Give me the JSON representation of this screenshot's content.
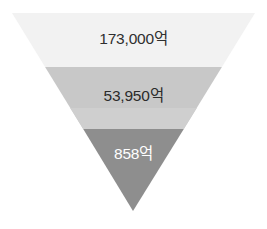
{
  "chart_data": {
    "type": "funnel",
    "title": "",
    "subtitle": "",
    "xlabel": "",
    "ylabel": "",
    "orientation": "inverted-triangle",
    "legend": [],
    "grid": false,
    "categories": [
      "173,000억",
      "53,950억",
      "858억"
    ],
    "values": [
      173000,
      53950,
      858
    ],
    "unit": "억",
    "value_labels": [
      "173,000억",
      "53,950억",
      "858억"
    ],
    "stages": [
      {
        "index": 1,
        "label": "173,000억",
        "value": 173000,
        "unit": "억",
        "fill": "#f2f2f2",
        "text_color": "#2f2f2f",
        "top_width_px": 243,
        "bottom_width_px": 176,
        "top_y_px": 13,
        "bottom_y_px": 67
      },
      {
        "index": 2,
        "label": "53,950억",
        "value": 53950,
        "unit": "억",
        "fill": "#c8c8c8",
        "fill_secondary": "#cfcfcf",
        "text_color": "#2b2b2b",
        "top_width_px": 176,
        "bottom_width_px": 100,
        "top_y_px": 67,
        "bottom_y_px": 129
      },
      {
        "index": 3,
        "label": "858억",
        "value": 858,
        "unit": "억",
        "fill": "#8e8e8e",
        "text_color": "#ffffff",
        "top_width_px": 100,
        "bottom_width_px": 0,
        "top_y_px": 129,
        "bottom_y_px": 211
      }
    ],
    "geometry": {
      "apex_x_px": 133,
      "apex_y_px": 211,
      "top_left_x_px": 12,
      "top_right_x_px": 255,
      "top_y_px": 13
    },
    "colors": {
      "background": "#ffffff",
      "stage_1": "#f2f2f2",
      "stage_2": "#c8c8c8",
      "stage_3": "#8e8e8e",
      "label_dark": "#2f2f2f",
      "label_light": "#ffffff"
    }
  }
}
